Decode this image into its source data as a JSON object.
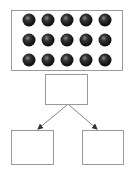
{
  "diagram": {
    "colors": {
      "background": "#ffffff",
      "box_stroke": "#9a9a9a",
      "arrow": "#555555",
      "ball": "#111111",
      "ball_highlight": "#888888"
    },
    "top_array": {
      "rows": 3,
      "columns": 5,
      "total_balls": 15,
      "x": 11,
      "y": 10,
      "width": 111,
      "height": 60
    },
    "middle_box": {
      "label": "",
      "x": 45,
      "y": 74,
      "width": 42,
      "height": 30
    },
    "branches": [
      {
        "label": "",
        "x": 11,
        "y": 130,
        "width": 42,
        "height": 34
      },
      {
        "label": "",
        "x": 82,
        "y": 130,
        "width": 41,
        "height": 34
      }
    ]
  }
}
